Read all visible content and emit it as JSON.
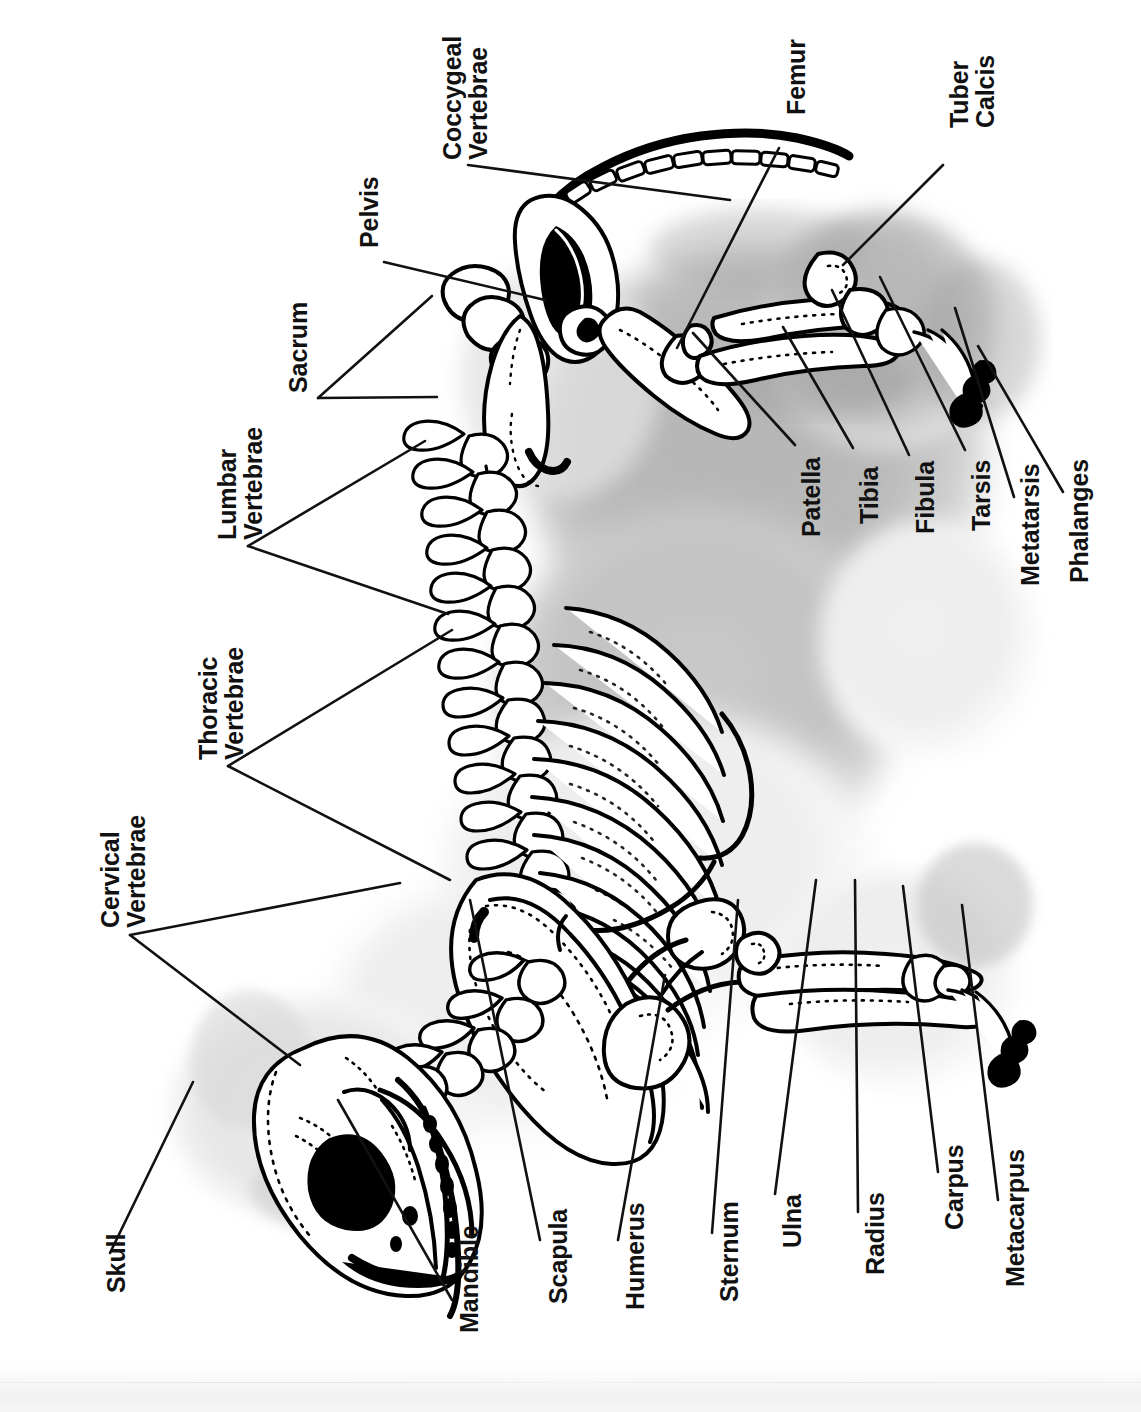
{
  "diagram": {
    "orientation": "rotated-90-ccw",
    "ink_color": "#111111",
    "background_color": "#ffffff",
    "silhouette_color": "#b9b9b9"
  },
  "labels": [
    {
      "id": "coccygeal-vertebrae",
      "text": "Coccygeal\nVertebrae",
      "x": 440,
      "y": 160,
      "lines": 2
    },
    {
      "id": "pelvis",
      "text": "Pelvis",
      "x": 356,
      "y": 248,
      "lines": 1
    },
    {
      "id": "sacrum",
      "text": "Sacrum",
      "x": 285,
      "y": 393,
      "lines": 1
    },
    {
      "id": "lumbar-vertebrae",
      "text": "Lumbar\nVertebrae",
      "x": 215,
      "y": 540,
      "lines": 2
    },
    {
      "id": "thoracic-vertebrae",
      "text": "Thoracic\nVertebrae",
      "x": 196,
      "y": 760,
      "lines": 2
    },
    {
      "id": "cervical-vertebrae",
      "text": "Cervical\nVertebrae",
      "x": 98,
      "y": 928,
      "lines": 2
    },
    {
      "id": "skull",
      "text": "Skull",
      "x": 103,
      "y": 1293,
      "lines": 1
    },
    {
      "id": "mandible",
      "text": "Mandible",
      "x": 456,
      "y": 1333,
      "lines": 1
    },
    {
      "id": "scapula",
      "text": "Scapula",
      "x": 545,
      "y": 1304,
      "lines": 1
    },
    {
      "id": "humerus",
      "text": "Humerus",
      "x": 622,
      "y": 1310,
      "lines": 1
    },
    {
      "id": "sternum",
      "text": "Sternum",
      "x": 716,
      "y": 1302,
      "lines": 1
    },
    {
      "id": "ulna",
      "text": "Ulna",
      "x": 779,
      "y": 1248,
      "lines": 1
    },
    {
      "id": "radius",
      "text": "Radius",
      "x": 862,
      "y": 1275,
      "lines": 1
    },
    {
      "id": "carpus",
      "text": "Carpus",
      "x": 941,
      "y": 1230,
      "lines": 1
    },
    {
      "id": "metacarpus",
      "text": "Metacarpus",
      "x": 1002,
      "y": 1287,
      "lines": 1
    },
    {
      "id": "femur",
      "text": "Femur",
      "x": 783,
      "y": 115,
      "lines": 1
    },
    {
      "id": "tuber-calcis",
      "text": "Tuber\nCalcis",
      "x": 947,
      "y": 128,
      "lines": 2
    },
    {
      "id": "patella",
      "text": "Patella",
      "x": 798,
      "y": 537,
      "lines": 1
    },
    {
      "id": "tibia",
      "text": "Tibia",
      "x": 856,
      "y": 524,
      "lines": 1
    },
    {
      "id": "fibula",
      "text": "Fibula",
      "x": 912,
      "y": 534,
      "lines": 1
    },
    {
      "id": "tarsis",
      "text": "Tarsis",
      "x": 968,
      "y": 531,
      "lines": 1
    },
    {
      "id": "metatarsis",
      "text": "Metatarsis",
      "x": 1017,
      "y": 586,
      "lines": 1
    },
    {
      "id": "phalanges",
      "text": "Phalanges",
      "x": 1066,
      "y": 583,
      "lines": 1
    }
  ],
  "leader_lines": [
    {
      "id": "coccygeal-vertebrae",
      "points": "468,165 730,200"
    },
    {
      "id": "pelvis",
      "points": "384,262 545,300"
    },
    {
      "id": "sacrum",
      "points": "318,398 432,296"
    },
    {
      "id": "sacrum-b",
      "points": "318,398 437,397"
    },
    {
      "id": "lumbar-vertebrae",
      "points": "248,546 425,441"
    },
    {
      "id": "lumbar-vertebrae-b",
      "points": "248,546 448,614"
    },
    {
      "id": "thoracic-vertebrae",
      "points": "228,766 452,630"
    },
    {
      "id": "thoracic-vertebrae-b",
      "points": "228,766 450,880"
    },
    {
      "id": "cervical-vertebrae",
      "points": "130,935 400,883"
    },
    {
      "id": "cervical-vertebrae-b",
      "points": "130,935 300,1065"
    },
    {
      "id": "skull",
      "points": "110,1253 193,1082"
    },
    {
      "id": "mandible",
      "points": "452,1300 338,1100"
    },
    {
      "id": "scapula",
      "points": "540,1240 470,900"
    },
    {
      "id": "humerus",
      "points": "618,1240 665,975"
    },
    {
      "id": "sternum",
      "points": "712,1233 738,900"
    },
    {
      "id": "ulna",
      "points": "775,1194 816,880"
    },
    {
      "id": "radius",
      "points": "858,1212 855,880"
    },
    {
      "id": "carpus",
      "points": "938,1172 903,886"
    },
    {
      "id": "metacarpus",
      "points": "998,1200 962,905"
    },
    {
      "id": "femur",
      "points": "779,148 677,348"
    },
    {
      "id": "tuber-calcis",
      "points": "943,165 843,265"
    },
    {
      "id": "patella",
      "points": "795,445 693,333"
    },
    {
      "id": "tibia",
      "points": "853,448 783,327"
    },
    {
      "id": "fibula",
      "points": "909,455 832,290"
    },
    {
      "id": "tarsis",
      "points": "965,450 880,277"
    },
    {
      "id": "metatarsis",
      "points": "1014,497 955,308"
    },
    {
      "id": "phalanges",
      "points": "1063,492 978,346"
    }
  ]
}
